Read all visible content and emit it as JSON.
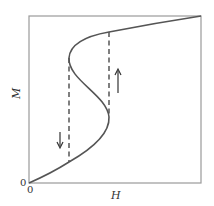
{
  "diagram": {
    "type": "magnetization-hysteresis-curve",
    "xlabel": "H",
    "ylabel": "M",
    "origin_x_label": "0",
    "origin_y_label": "0",
    "colors": {
      "frame": "#9a9a9a",
      "curve": "#555555",
      "dashed": "#555555",
      "arrow": "#333333",
      "background": "#ffffff"
    },
    "annotations": [
      {
        "kind": "arrow",
        "direction": "down",
        "position": "left of S-curve"
      },
      {
        "kind": "arrow",
        "direction": "up",
        "position": "right of S-curve"
      },
      {
        "kind": "dashed-line",
        "description": "vertical jump on decreasing branch"
      },
      {
        "kind": "dashed-line",
        "description": "vertical jump on increasing branch"
      }
    ]
  }
}
